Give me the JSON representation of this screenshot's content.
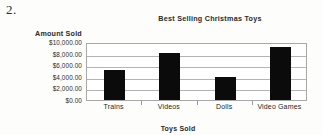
{
  "question_number": "2.",
  "chart_data": {
    "type": "bar",
    "title": "Best Selling Christmas Toys",
    "xlabel": "Toys Sold",
    "ylabel": "Amount Sold",
    "categories": [
      "Trains",
      "Videos",
      "Dolls",
      "Video Games"
    ],
    "values": [
      5200,
      8050,
      4050,
      9200
    ],
    "ylim": [
      0,
      10000
    ],
    "ytick_values": [
      10000,
      8000,
      6000,
      4000,
      2000,
      0
    ],
    "ytick_labels": [
      "$10,000.00",
      "$8,000.00",
      "$6,000.00",
      "$4,000.00",
      "$2,000.00",
      "$0.00"
    ],
    "grid": true,
    "legend": false,
    "bar_color": "#0b0b0b",
    "gridline_color": "#b4b4b4",
    "plot_border_color": "#a8a8a8",
    "background_color": "#fdfdfc"
  }
}
